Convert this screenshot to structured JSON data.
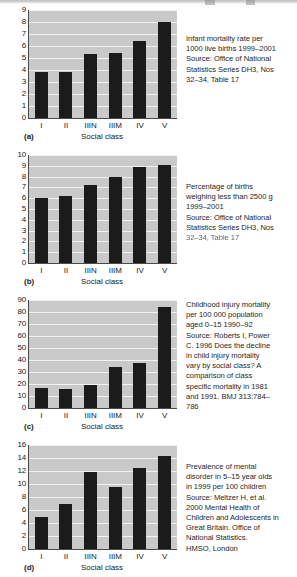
{
  "document": {
    "kind": "figure-panel-set",
    "shared_xlabel": "Social class",
    "categories": [
      "I",
      "II",
      "IIIN",
      "IIIM",
      "IV",
      "V"
    ],
    "bar_color": "#1b1b1b",
    "plot_background": "#c9c9c9",
    "gridline_color": "#f2f2f2",
    "axis_color": "#4a4a4a"
  },
  "panels": [
    {
      "letter": "(a)",
      "xlabel": "Social class",
      "caption_lines": [
        "Infant mortality rate per",
        "1000 live births 1999–2001",
        "Source: Office of National",
        "Statistics Series DH3, Nos",
        "32–34, Table 17"
      ],
      "chart_data": {
        "type": "bar",
        "title": "Infant mortality rate per 1000 live births 1999–2001",
        "xlabel": "Social class",
        "ylabel": "",
        "categories": [
          "I",
          "II",
          "IIIN",
          "IIIM",
          "IV",
          "V"
        ],
        "values": [
          3.8,
          3.85,
          5.35,
          5.45,
          6.4,
          8.0
        ],
        "ylim": [
          0,
          9
        ],
        "yticks": [
          0,
          1,
          2,
          3,
          4,
          5,
          6,
          7,
          8,
          9
        ],
        "grid": true,
        "legend": "none"
      }
    },
    {
      "letter": "(b)",
      "xlabel": "Social class",
      "caption_lines": [
        "Percentage of births",
        "weighing less than 2500 g",
        "1999–2001",
        "Source: Office of National",
        "Statistics Series DH3, Nos",
        "32–34, Table 17"
      ],
      "chart_data": {
        "type": "bar",
        "title": "Percentage of births weighing less than 2500 g 1999–2001",
        "xlabel": "Social class",
        "ylabel": "",
        "categories": [
          "I",
          "II",
          "IIIN",
          "IIIM",
          "IV",
          "V"
        ],
        "values": [
          6.0,
          6.25,
          7.2,
          8.0,
          8.9,
          9.1
        ],
        "ylim": [
          0,
          10
        ],
        "yticks": [
          0,
          1,
          2,
          3,
          4,
          5,
          6,
          7,
          8,
          9,
          10
        ],
        "grid": true,
        "legend": "none"
      }
    },
    {
      "letter": "(c)",
      "xlabel": "Social class",
      "caption_lines": [
        "Childhood injury mortality",
        "per 100 000 population",
        "aged 0–15 1990–92",
        "Source: Roberts I, Power",
        "C. 1996 Does the decline",
        "in child injury mortality",
        "vary by social class? A",
        "comparison of class",
        "specific mortality in 1981",
        "and 1991. BMJ 313:784–",
        "786"
      ],
      "chart_data": {
        "type": "bar",
        "title": "Childhood injury mortality per 100 000 population aged 0–15 1990–92",
        "xlabel": "Social class",
        "ylabel": "",
        "categories": [
          "I",
          "II",
          "IIIN",
          "IIIM",
          "IV",
          "V"
        ],
        "values": [
          16.5,
          16.0,
          19.5,
          34.5,
          37.5,
          84.0
        ],
        "ylim": [
          0,
          90
        ],
        "yticks": [
          0,
          10,
          20,
          30,
          40,
          50,
          60,
          70,
          80,
          90
        ],
        "grid": true,
        "legend": "none"
      }
    },
    {
      "letter": "(d)",
      "xlabel": "Social class",
      "caption_lines": [
        "Prevalence of mental",
        "disorder in 5–15 year olds",
        "in 1999 per 100 children",
        "Source: Meltzer H, et al.",
        "2000 Mental Health of",
        "Children and Adolescents in",
        "Great Britain. Office of",
        "National Statistics.",
        "HMSO, London"
      ],
      "chart_data": {
        "type": "bar",
        "title": "Prevalence of mental disorder in 5–15 year olds in 1999 per 100 children",
        "xlabel": "Social class",
        "ylabel": "",
        "categories": [
          "I",
          "II",
          "IIIN",
          "IIIM",
          "IV",
          "V"
        ],
        "values": [
          5.0,
          6.9,
          11.8,
          9.5,
          12.4,
          14.3
        ],
        "ylim": [
          0,
          16
        ],
        "yticks": [
          0,
          2,
          4,
          6,
          8,
          10,
          12,
          14,
          16
        ],
        "grid": true,
        "legend": "none"
      }
    }
  ]
}
